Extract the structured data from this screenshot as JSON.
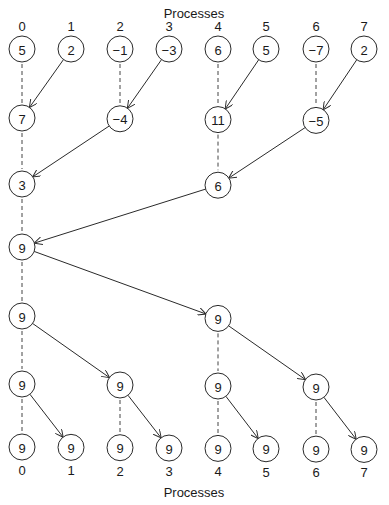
{
  "title_top": "Processes",
  "title_bottom": "Processes",
  "process_labels": [
    "0",
    "1",
    "2",
    "3",
    "4",
    "5",
    "6",
    "7"
  ],
  "reduction_phase": [
    {
      "step": 0,
      "nodes": [
        {
          "proc": 0,
          "value": "5"
        },
        {
          "proc": 1,
          "value": "2"
        },
        {
          "proc": 2,
          "value": "−1"
        },
        {
          "proc": 3,
          "value": "−3"
        },
        {
          "proc": 4,
          "value": "6"
        },
        {
          "proc": 5,
          "value": "5"
        },
        {
          "proc": 6,
          "value": "−7"
        },
        {
          "proc": 7,
          "value": "2"
        }
      ]
    },
    {
      "step": 1,
      "nodes": [
        {
          "proc": 0,
          "value": "7"
        },
        {
          "proc": 2,
          "value": "−4"
        },
        {
          "proc": 4,
          "value": "11"
        },
        {
          "proc": 6,
          "value": "−5"
        }
      ]
    },
    {
      "step": 2,
      "nodes": [
        {
          "proc": 0,
          "value": "3"
        },
        {
          "proc": 4,
          "value": "6"
        }
      ]
    },
    {
      "step": 3,
      "nodes": [
        {
          "proc": 0,
          "value": "9"
        }
      ]
    }
  ],
  "broadcast_phase": [
    {
      "step": 4,
      "nodes": [
        {
          "proc": 0,
          "value": "9"
        },
        {
          "proc": 4,
          "value": "9"
        }
      ]
    },
    {
      "step": 5,
      "nodes": [
        {
          "proc": 0,
          "value": "9"
        },
        {
          "proc": 2,
          "value": "9"
        },
        {
          "proc": 4,
          "value": "9"
        },
        {
          "proc": 6,
          "value": "9"
        }
      ]
    },
    {
      "step": 6,
      "nodes": [
        {
          "proc": 0,
          "value": "9"
        },
        {
          "proc": 1,
          "value": "9"
        },
        {
          "proc": 2,
          "value": "9"
        },
        {
          "proc": 3,
          "value": "9"
        },
        {
          "proc": 4,
          "value": "9"
        },
        {
          "proc": 5,
          "value": "9"
        },
        {
          "proc": 6,
          "value": "9"
        },
        {
          "proc": 7,
          "value": "9"
        }
      ]
    }
  ],
  "messages": [
    {
      "from": [
        0,
        1
      ],
      "to": [
        1,
        0
      ]
    },
    {
      "from": [
        0,
        3
      ],
      "to": [
        1,
        2
      ]
    },
    {
      "from": [
        0,
        5
      ],
      "to": [
        1,
        4
      ]
    },
    {
      "from": [
        0,
        7
      ],
      "to": [
        1,
        6
      ]
    },
    {
      "from": [
        1,
        2
      ],
      "to": [
        2,
        0
      ]
    },
    {
      "from": [
        1,
        6
      ],
      "to": [
        2,
        4
      ]
    },
    {
      "from": [
        2,
        4
      ],
      "to": [
        3,
        0
      ]
    },
    {
      "from": [
        3,
        0
      ],
      "to": [
        4,
        4
      ]
    },
    {
      "from": [
        4,
        0
      ],
      "to": [
        5,
        2
      ]
    },
    {
      "from": [
        4,
        4
      ],
      "to": [
        5,
        6
      ]
    },
    {
      "from": [
        5,
        0
      ],
      "to": [
        6,
        1
      ]
    },
    {
      "from": [
        5,
        2
      ],
      "to": [
        6,
        3
      ]
    },
    {
      "from": [
        5,
        4
      ],
      "to": [
        6,
        5
      ]
    },
    {
      "from": [
        5,
        6
      ],
      "to": [
        6,
        7
      ]
    }
  ],
  "local_carries": [
    {
      "proc": 0,
      "from": 0,
      "to": 1
    },
    {
      "proc": 2,
      "from": 0,
      "to": 1
    },
    {
      "proc": 4,
      "from": 0,
      "to": 1
    },
    {
      "proc": 6,
      "from": 0,
      "to": 1
    },
    {
      "proc": 0,
      "from": 1,
      "to": 2
    },
    {
      "proc": 4,
      "from": 1,
      "to": 2
    },
    {
      "proc": 0,
      "from": 2,
      "to": 3
    },
    {
      "proc": 0,
      "from": 3,
      "to": 4
    },
    {
      "proc": 0,
      "from": 4,
      "to": 5
    },
    {
      "proc": 4,
      "from": 4,
      "to": 5
    },
    {
      "proc": 0,
      "from": 5,
      "to": 6
    },
    {
      "proc": 2,
      "from": 5,
      "to": 6
    },
    {
      "proc": 4,
      "from": 5,
      "to": 6
    },
    {
      "proc": 6,
      "from": 5,
      "to": 6
    }
  ]
}
